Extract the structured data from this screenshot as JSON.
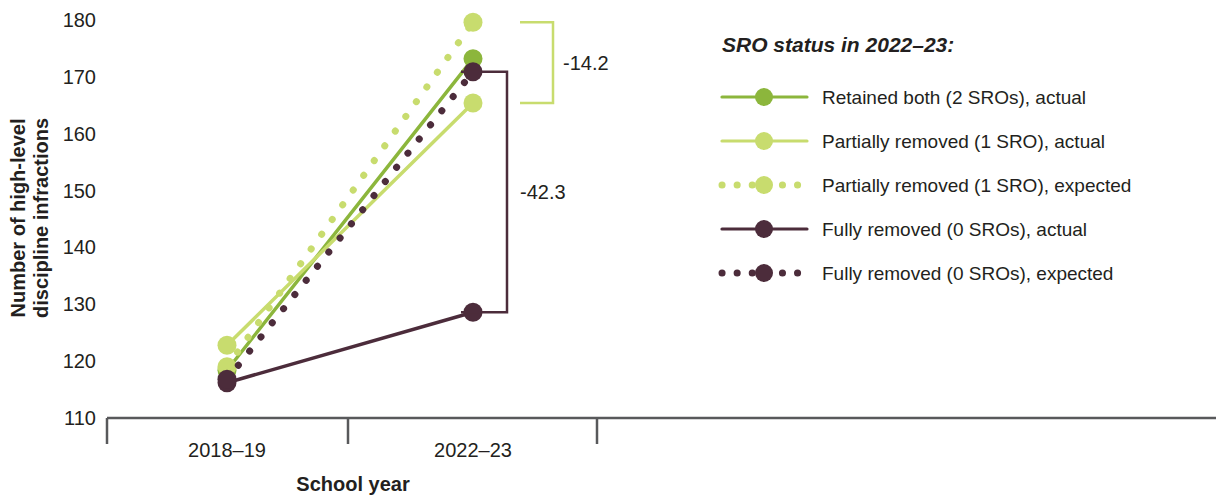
{
  "chart_data": {
    "type": "line",
    "title": "",
    "xlabel": "School year",
    "ylabel": "Number of high-level discipline infractions",
    "categories": [
      "2018–19",
      "2022–23"
    ],
    "ylim": [
      110,
      180
    ],
    "yticks": [
      110,
      120,
      130,
      140,
      150,
      160,
      170,
      180
    ],
    "ytick_labels": [
      "110",
      "120",
      "130",
      "140",
      "150",
      "160",
      "170",
      "180"
    ],
    "grid": false,
    "legend_position": "right",
    "legend_title": "SRO status in 2022–23:",
    "series": [
      {
        "name": "Retained both (2 SROs), actual",
        "style": "solid",
        "color": "#8cb63c",
        "values": [
          118.4,
          173.2
        ]
      },
      {
        "name": "Partially removed (1 SRO), actual",
        "style": "solid",
        "color": "#c8dc6e",
        "values": [
          122.8,
          165.4
        ]
      },
      {
        "name": "Partially removed (1 SRO), expected",
        "style": "dotted",
        "color": "#c8dc6e",
        "values": [
          119.0,
          179.6
        ]
      },
      {
        "name": "Fully removed (0 SROs), actual",
        "style": "solid",
        "color": "#4c2c3b",
        "values": [
          116.2,
          128.6
        ]
      },
      {
        "name": "Fully removed (0 SROs), expected",
        "style": "dotted",
        "color": "#4c2c3b",
        "values": [
          116.8,
          170.9
        ]
      }
    ],
    "annotations": [
      {
        "label": "-14.2",
        "color": "#c8dc6e",
        "from_value": 179.6,
        "to_value": 165.4,
        "description": "Partially removed: expected minus actual in 2022–23"
      },
      {
        "label": "-42.3",
        "color": "#4c2c3b",
        "from_value": 170.9,
        "to_value": 128.6,
        "description": "Fully removed: expected minus actual in 2022–23"
      }
    ]
  },
  "axes": {
    "y_label_line1": "Number of high-level",
    "y_label_line2": "discipline infractions",
    "x_label": "School year",
    "x_tick_labels": [
      "2018–19",
      "2022–23"
    ],
    "y_tick_labels": [
      "180",
      "170",
      "160",
      "150",
      "140",
      "130",
      "120",
      "110"
    ]
  },
  "legend": {
    "title": "SRO status in 2022–23:",
    "items": [
      {
        "label": "Retained both (2 SROs), actual",
        "color": "#8cb63c",
        "style": "solid"
      },
      {
        "label": "Partially removed (1 SRO), actual",
        "color": "#c8dc6e",
        "style": "solid"
      },
      {
        "label": "Partially removed (1 SRO), expected",
        "color": "#c8dc6e",
        "style": "dotted"
      },
      {
        "label": "Fully removed (0 SROs), actual",
        "color": "#4c2c3b",
        "style": "solid"
      },
      {
        "label": "Fully removed (0 SROs), expected",
        "color": "#4c2c3b",
        "style": "dotted"
      }
    ]
  },
  "annotation_labels": {
    "upper": "-14.2",
    "lower": "-42.3"
  },
  "colors": {
    "green_dark": "#8cb63c",
    "green_light": "#c8dc6e",
    "purple": "#4c2c3b",
    "axis": "#58595b",
    "text": "#231f20"
  }
}
